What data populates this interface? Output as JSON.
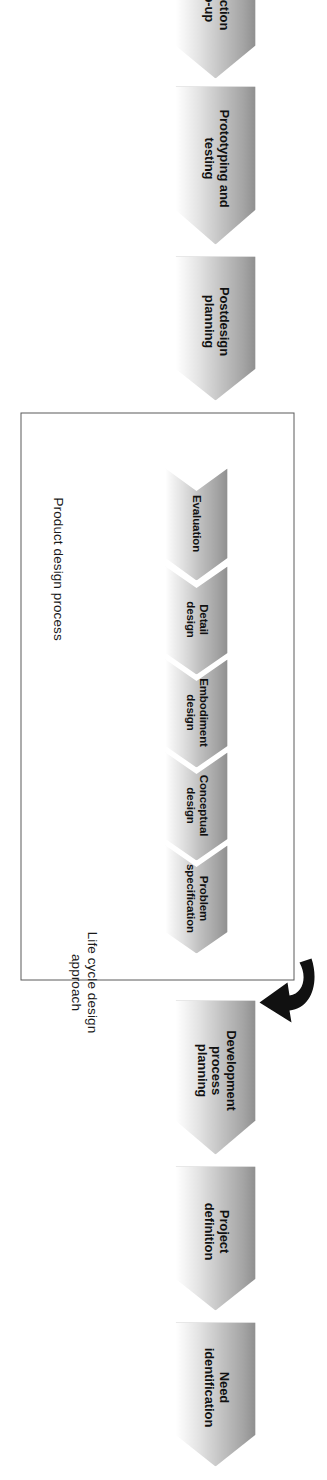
{
  "diagram": {
    "type": "process-flow-chevrons",
    "orientation": "vertical-rotated-90",
    "outer_box": {
      "label": "Product design process"
    },
    "annotation": {
      "label": "Life cycle design\napproach",
      "arrow": "curved-down-arrow-icon"
    },
    "stages": [
      {
        "id": "need-identification",
        "label": "Need\nidentification"
      },
      {
        "id": "project-definition",
        "label": "Project\ndefinition"
      },
      {
        "id": "development-process-planning",
        "label": "Development\nprocess\nplanning"
      },
      {
        "id": "postdesign-planning",
        "label": "Postdesign\nplanning"
      },
      {
        "id": "prototyping-and-testing",
        "label": "Prototyping and\ntesting"
      },
      {
        "id": "production-ramp-up",
        "label": "Production\nramp-up"
      }
    ],
    "inner_stages": [
      {
        "id": "problem-specification",
        "label": "Problem\nspecification"
      },
      {
        "id": "conceptual-design",
        "label": "Conceptual\ndesign"
      },
      {
        "id": "embodiment-design",
        "label": "Embodiment\ndesign"
      },
      {
        "id": "detail-design",
        "label": "Detail\ndesign"
      },
      {
        "id": "evaluation",
        "label": "Evaluation"
      }
    ],
    "colors": {
      "chevron_fill_dark": "#8f8f8f",
      "chevron_fill_light": "#ffffff",
      "chevron_stroke": "#4a4a4a",
      "box_stroke": "#5a5a5a",
      "arrow_fill": "#111111",
      "text": "#111111",
      "background": "#ffffff"
    }
  }
}
